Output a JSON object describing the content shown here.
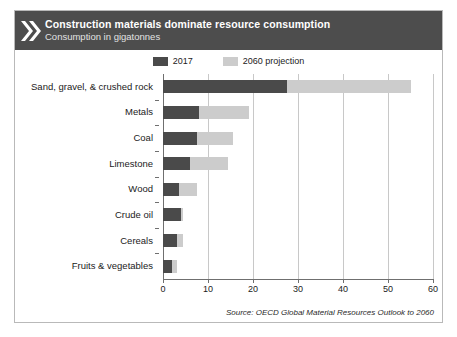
{
  "header": {
    "title": "Construction materials dominate resource consumption",
    "subtitle": "Consumption in gigatonnes",
    "icon": "double-chevron-right-icon",
    "background_color": "#4d4d4d",
    "title_color": "#ffffff"
  },
  "legend": {
    "position": "top-center",
    "entries": [
      {
        "label": "2017",
        "color": "#4a4a4a"
      },
      {
        "label": "2060 projection",
        "color": "#cccccc"
      }
    ]
  },
  "source": {
    "text": "Source: OECD Global Material Resources Outlook to 2060"
  },
  "chart_data": {
    "type": "bar",
    "orientation": "horizontal",
    "stacked": true,
    "title": "Construction materials dominate resource consumption",
    "subtitle": "Consumption in gigatonnes",
    "xlabel": "",
    "ylabel": "",
    "xlim": [
      0,
      60
    ],
    "xticks": [
      0,
      10,
      20,
      30,
      40,
      50,
      60
    ],
    "grid": true,
    "grid_axis": "x",
    "categories": [
      "Sand, gravel, & crushed rock",
      "Metals",
      "Coal",
      "Limestone",
      "Wood",
      "Crude oil",
      "Cereals",
      "Fruits & vegetables"
    ],
    "series": [
      {
        "name": "2017",
        "color": "#4a4a4a",
        "values": [
          27.5,
          8.0,
          7.5,
          6.0,
          3.5,
          4.0,
          3.0,
          2.0
        ]
      },
      {
        "name": "2060 projection",
        "color": "#cccccc",
        "values": [
          55.0,
          19.0,
          15.5,
          14.5,
          7.5,
          4.5,
          4.5,
          3.0
        ]
      }
    ]
  }
}
